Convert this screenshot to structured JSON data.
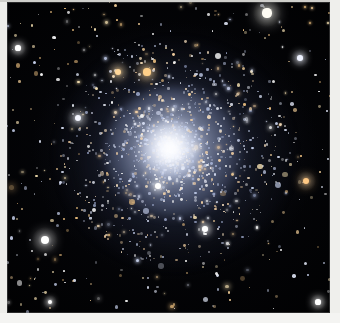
{
  "image": {
    "kind": "astronomical-photograph",
    "subject": "globular star cluster",
    "alt_text": "Astronomical photograph of a globular star cluster: a dense spherical swarm of thousands of stars with a brilliant white unresolved core, resolved blue-white stars across the halo, and scattered foreground field stars on a black sky.",
    "caption": "",
    "width_px": 340,
    "height_px": 323
  },
  "frame": {
    "border_color": "#ededea",
    "border_shade_color": "#cfcfcb",
    "plate_left_px": 7,
    "plate_top_px": 2,
    "plate_width_px": 323,
    "plate_height_px": 311
  },
  "sky": {
    "background_color": "#000000",
    "wash_color": "#1a1e2c"
  },
  "cluster": {
    "center_x_px": 172,
    "center_y_px": 150,
    "core_color": "#ffffff",
    "halo_color": "#96a5cd",
    "core_radius_px": 26,
    "halo_radius_px": 116,
    "star_count_rendered": 1650
  },
  "field": {
    "star_count_rendered": 420,
    "star_colors": [
      "#ffffff",
      "#e8eeff",
      "#cfd9f5",
      "#ffe9b8",
      "#ffcf8a",
      "#ffd9a0"
    ]
  },
  "bright_stars": [
    {
      "name": "field-star-upper-right",
      "x": 267,
      "y": 13,
      "r": 4.6,
      "color": "#fffdf4"
    },
    {
      "name": "field-star-left-mid",
      "x": 18,
      "y": 48,
      "r": 2.6,
      "color": "#ffffff"
    },
    {
      "name": "field-star-left-lower",
      "x": 45,
      "y": 240,
      "r": 4.2,
      "color": "#ffffff"
    },
    {
      "name": "field-star-cluster-nw",
      "x": 78,
      "y": 118,
      "r": 3.4,
      "color": "#f4f6ff"
    },
    {
      "name": "field-star-amber-a",
      "x": 118,
      "y": 72,
      "r": 3.4,
      "color": "#ffd79a"
    },
    {
      "name": "field-star-amber-b",
      "x": 147,
      "y": 72,
      "r": 3.6,
      "color": "#ffd089"
    },
    {
      "name": "field-star-amber-right",
      "x": 306,
      "y": 181,
      "r": 3.2,
      "color": "#ffc985"
    },
    {
      "name": "field-star-core-south",
      "x": 158,
      "y": 186,
      "r": 3.2,
      "color": "#ffffff"
    },
    {
      "name": "field-star-right-upper",
      "x": 300,
      "y": 58,
      "r": 2.8,
      "color": "#eef2ff"
    },
    {
      "name": "field-star-bottom-right",
      "x": 318,
      "y": 302,
      "r": 2.6,
      "color": "#ffffff"
    },
    {
      "name": "field-star-bottom-left",
      "x": 50,
      "y": 302,
      "r": 2.2,
      "color": "#ffffff"
    },
    {
      "name": "field-star-lower-mid",
      "x": 205,
      "y": 229,
      "r": 2.8,
      "color": "#ffffff"
    }
  ]
}
